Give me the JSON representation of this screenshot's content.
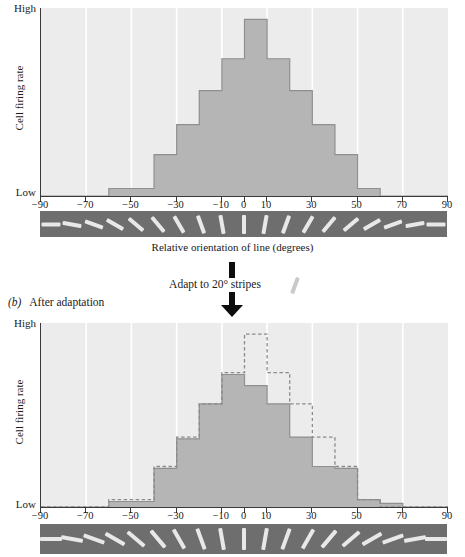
{
  "figure": {
    "xaxis_caption": "Relative orientation of line (degrees)",
    "ylabel": "Cell firing rate",
    "ylabel_high": "High",
    "ylabel_low": "Low",
    "x_ticklabels": [
      "−90",
      "−70",
      "−50",
      "−30",
      "−10",
      "0",
      "10",
      "30",
      "50",
      "70",
      "90"
    ],
    "x_tickvalues": [
      -90,
      -70,
      -50,
      -30,
      -10,
      0,
      10,
      30,
      50,
      70,
      90
    ],
    "panel_a_label": "",
    "panel_b_label_tag": "(b)",
    "panel_b_label_text": "After adaptation",
    "adapt_text": "Adapt to 20° stripes",
    "adapt_sample_angle_deg": 20,
    "colors": {
      "plot_background": "#ececec",
      "gridline": "#ffffff",
      "bar_fill": "#b5b5b5",
      "bar_stroke": "#8f8f8f",
      "dashed_stroke": "#8a8a8a",
      "axis": "#3a3a3a",
      "stripe_strip_background": "#6e6e6e",
      "stripe_color": "#e8e8e8",
      "arrow": "#0d0d0d",
      "text": "#1a1a1a"
    }
  },
  "chart_data": [
    {
      "id": "panel-a",
      "type": "bar",
      "title": "Before adaptation",
      "xlabel": "Relative orientation of line (degrees)",
      "ylabel": "Cell firing rate",
      "xlim": [
        -90,
        90
      ],
      "ylim": [
        0,
        1
      ],
      "ytick_labels": [
        "Low",
        "High"
      ],
      "grid": true,
      "bin_width": 10,
      "bin_centers": [
        -85,
        -75,
        -65,
        -55,
        -45,
        -35,
        -25,
        -15,
        -5,
        5,
        15,
        25,
        35,
        45,
        55,
        65,
        75,
        85
      ],
      "bin_edges": [
        -90,
        -80,
        -70,
        -60,
        -50,
        -40,
        -30,
        -20,
        -10,
        0,
        10,
        20,
        30,
        40,
        50,
        60,
        70,
        80,
        90
      ],
      "series": [
        {
          "name": "Before adaptation",
          "style": "solid-filled",
          "values": [
            0.0,
            0.0,
            0.0,
            0.04,
            0.04,
            0.22,
            0.38,
            0.56,
            0.73,
            0.94,
            0.73,
            0.56,
            0.38,
            0.22,
            0.04,
            0.0,
            0.0,
            0.0
          ]
        }
      ]
    },
    {
      "id": "panel-b",
      "type": "bar",
      "title": "After adaptation",
      "xlabel": "Relative orientation of line (degrees)",
      "ylabel": "Cell firing rate",
      "xlim": [
        -90,
        90
      ],
      "ylim": [
        0,
        1
      ],
      "ytick_labels": [
        "Low",
        "High"
      ],
      "grid": true,
      "bin_width": 10,
      "bin_centers": [
        -85,
        -75,
        -65,
        -55,
        -45,
        -35,
        -25,
        -15,
        -5,
        5,
        15,
        25,
        35,
        45,
        55,
        65,
        75,
        85
      ],
      "bin_edges": [
        -90,
        -80,
        -70,
        -60,
        -50,
        -40,
        -30,
        -20,
        -10,
        0,
        10,
        20,
        30,
        40,
        50,
        60,
        70,
        80,
        90
      ],
      "series": [
        {
          "name": "After adaptation",
          "style": "solid-filled",
          "values": [
            0.0,
            0.0,
            0.0,
            0.03,
            0.03,
            0.21,
            0.37,
            0.56,
            0.72,
            0.66,
            0.56,
            0.38,
            0.22,
            0.21,
            0.04,
            0.02,
            0.0,
            0.0
          ]
        },
        {
          "name": "Before adaptation (reference)",
          "style": "dashed-outline",
          "values": [
            0.0,
            0.0,
            0.0,
            0.04,
            0.04,
            0.22,
            0.38,
            0.56,
            0.73,
            0.94,
            0.73,
            0.56,
            0.38,
            0.22,
            0.04,
            0.0,
            0.0,
            0.0
          ]
        }
      ]
    }
  ],
  "stripes": {
    "count": 19,
    "angles_deg": [
      -90,
      -80,
      -70,
      -60,
      -50,
      -40,
      -30,
      -20,
      -10,
      0,
      10,
      20,
      30,
      40,
      50,
      60,
      70,
      80,
      90
    ],
    "description": "orientation swatch strip"
  }
}
